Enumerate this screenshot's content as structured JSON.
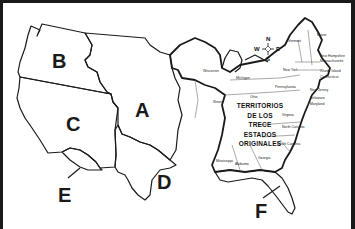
{
  "map": {
    "title_lines": [
      "TERRITORIOS",
      "DE LOS",
      "TRECE",
      "ESTADOS",
      "ORIGINALES"
    ],
    "region_labels": {
      "A": "A",
      "B": "B",
      "C": "C",
      "D": "D",
      "E": "E",
      "F": "F"
    },
    "compass": {
      "north": "N",
      "south": "S",
      "east": "E",
      "west": "W"
    },
    "states": {
      "maine": "Maine",
      "vermont": "Vermont",
      "new_hampshire": "New Hampshire",
      "massachusetts": "Massachusetts",
      "rhode_island": "Rhode Island",
      "connecticut": "Connecticut",
      "new_york": "New York",
      "new_jersey": "New Jersey",
      "delaware": "Delaware",
      "maryland": "Maryland",
      "pennsylvania": "Pennsylvania",
      "virginia": "Virginia",
      "north_carolina": "North Carolina",
      "south_carolina": "South Carolina",
      "georgia": "Georgia",
      "alabama": "Alabama",
      "mississippi": "Mississippi",
      "wisconsin": "Wisconsin",
      "michigan": "Michigan",
      "illinois": "Illinois",
      "ohio": "Ohio"
    },
    "colors": {
      "ink": "#1a1a1a",
      "background": "#ffffff"
    }
  }
}
